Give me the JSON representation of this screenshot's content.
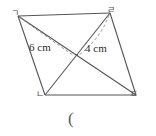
{
  "figure": {
    "type": "parallelogram-with-diagonals",
    "stroke_color": "#555555",
    "dashed_color": "#8a8a8a",
    "background": "#ffffff",
    "vertices": [
      {
        "name": "top-left",
        "label": "ㄱ",
        "x": 18,
        "y": 16
      },
      {
        "name": "top-right",
        "label": "ㄹ",
        "x": 110,
        "y": 13
      },
      {
        "name": "bottom-right",
        "label": "ㄷ",
        "x": 136,
        "y": 95
      },
      {
        "name": "bottom-left",
        "label": "ㄴ",
        "x": 45,
        "y": 95
      }
    ],
    "intersection": {
      "x": 77,
      "y": 55
    },
    "measurements": [
      {
        "name": "left-height",
        "label": "6 cm",
        "value": 6,
        "unit": "cm"
      },
      {
        "name": "right-height",
        "label": "4 cm",
        "value": 4,
        "unit": "cm"
      }
    ],
    "caption": "("
  }
}
